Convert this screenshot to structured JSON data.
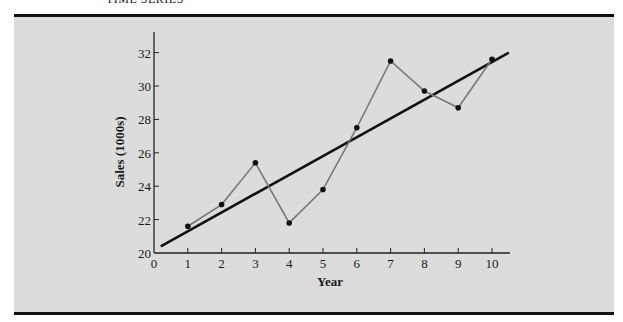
{
  "page": {
    "header": "TIME SERIES"
  },
  "chart_data": {
    "type": "line",
    "title": "",
    "xlabel": "Year",
    "ylabel": "Sales (1000s)",
    "x": [
      1,
      2,
      3,
      4,
      5,
      6,
      7,
      8,
      9,
      10
    ],
    "series": [
      {
        "name": "Sales",
        "values": [
          21.6,
          22.9,
          25.4,
          21.8,
          23.8,
          27.5,
          31.5,
          29.7,
          28.7,
          31.6
        ],
        "color": "#777777",
        "markers": true
      },
      {
        "name": "Trend line",
        "type": "line",
        "x": [
          0.2,
          10.5
        ],
        "values": [
          20.4,
          32.0
        ],
        "color": "#111111"
      }
    ],
    "xticks": [
      0,
      1,
      2,
      3,
      4,
      5,
      6,
      7,
      8,
      9,
      10
    ],
    "yticks": [
      20,
      22,
      24,
      26,
      28,
      30,
      32
    ],
    "xlim": [
      0,
      10.5
    ],
    "ylim": [
      20,
      33
    ],
    "grid": false,
    "legend": null
  },
  "colors": {
    "panel_bg": "#dcdcdc",
    "rule": "#111111",
    "series_line": "#777777",
    "trend_line": "#111111",
    "marker": "#111111"
  }
}
